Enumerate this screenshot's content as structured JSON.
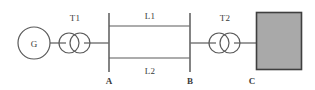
{
  "diagram": {
    "type": "single-line-diagram",
    "colors": {
      "line": "#5a5a5a",
      "bus": "#6e6e6e",
      "load_fill": "#a9a9a9",
      "load_border": "#3f3f3f",
      "text": "#3a3a3a",
      "background": "#ffffff"
    },
    "components": {
      "generator": {
        "label": "G",
        "name": "generator",
        "cx": 34,
        "cy": 43,
        "r": 16
      },
      "transformer_1": {
        "label": "T1",
        "name": "transformer-t1",
        "cx": 75,
        "cy": 43,
        "r": 10,
        "offset": 6,
        "label_x": 75,
        "label_y": 20
      },
      "transformer_2": {
        "label": "T2",
        "name": "transformer-t2",
        "cx": 225,
        "cy": 43,
        "r": 10,
        "offset": 6,
        "label_x": 225,
        "label_y": 20
      },
      "bus_a": {
        "label": "A",
        "name": "bus-a",
        "x": 109,
        "y_top": 13,
        "y_bottom": 72,
        "label_x": 109,
        "label_y": 83
      },
      "bus_b": {
        "label": "B",
        "name": "bus-b",
        "x": 190,
        "y_top": 13,
        "y_bottom": 72,
        "label_x": 190,
        "label_y": 83
      },
      "load": {
        "label": "C",
        "name": "load-c",
        "x": 256,
        "y": 12,
        "width": 46,
        "height": 58,
        "label_x": 252,
        "label_y": 83
      },
      "line_1": {
        "label": "L1",
        "name": "transmission-line-l1",
        "y": 26,
        "x_start": 109,
        "x_end": 190,
        "label_x": 150,
        "label_y": 18
      },
      "line_2": {
        "label": "L2",
        "name": "transmission-line-l2",
        "y": 58,
        "x_start": 109,
        "x_end": 190,
        "label_x": 150,
        "label_y": 73
      }
    },
    "connections": [
      {
        "name": "generator-to-t1",
        "x1": 50,
        "y1": 43,
        "x2": 65,
        "y2": 43
      },
      {
        "name": "t1-to-bus-a",
        "x1": 85,
        "y1": 43,
        "x2": 109,
        "y2": 43
      },
      {
        "name": "bus-b-to-t2",
        "x1": 190,
        "y1": 43,
        "x2": 215,
        "y2": 43
      },
      {
        "name": "t2-to-load",
        "x1": 235,
        "y1": 43,
        "x2": 256,
        "y2": 43
      }
    ]
  }
}
